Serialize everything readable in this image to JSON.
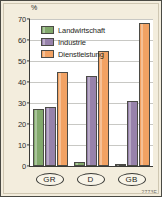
{
  "figure": {
    "code": "2773E",
    "background_color": "#f3eddd",
    "plot_background_color": "#ffffff",
    "border_color": "#4a4a44"
  },
  "chart_data": {
    "type": "bar",
    "title": "",
    "xlabel": "",
    "ylabel": "%",
    "unit_label": "%",
    "categories": [
      "GR",
      "D",
      "GB"
    ],
    "series": [
      {
        "name": "Landwirtschaft",
        "color": "#82a96c",
        "values": [
          27,
          2,
          1
        ]
      },
      {
        "name": "Industrie",
        "color": "#9782ab",
        "values": [
          28,
          43,
          31
        ]
      },
      {
        "name": "Dienstleistung",
        "color": "#f2a263",
        "values": [
          45,
          55,
          68
        ]
      }
    ],
    "ylim": [
      0,
      70
    ],
    "yticks": [
      0,
      10,
      20,
      30,
      40,
      50,
      60,
      70
    ],
    "ytick_labels": [
      "0",
      "10",
      "20",
      "30",
      "40",
      "50",
      "60",
      "70"
    ],
    "grid": true,
    "legend_position": "top-left"
  }
}
